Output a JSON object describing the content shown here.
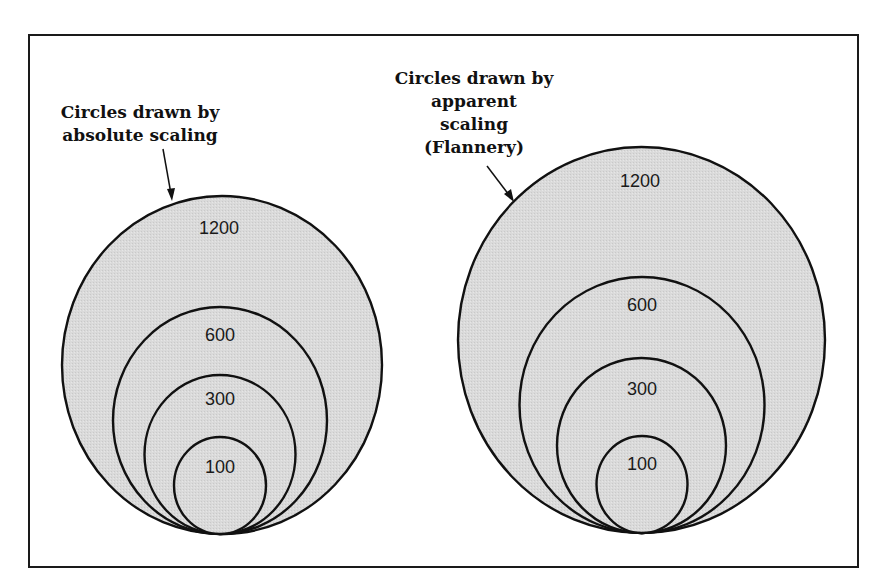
{
  "figure": {
    "colors": {
      "fill": "#d9d9d9",
      "stroke": "#111111",
      "background": "#ffffff"
    },
    "left_group": {
      "caption_lines": [
        "Circles drawn by",
        "absolute scaling"
      ],
      "method": "absolute scaling",
      "circles": [
        {
          "label": "1200",
          "value": 1200
        },
        {
          "label": "600",
          "value": 600
        },
        {
          "label": "300",
          "value": 300
        },
        {
          "label": "100",
          "value": 100
        }
      ]
    },
    "right_group": {
      "caption_lines": [
        "Circles drawn by",
        "apparent",
        "scaling",
        "(Flannery)"
      ],
      "method": "apparent scaling (Flannery)",
      "circles": [
        {
          "label": "1200",
          "value": 1200
        },
        {
          "label": "600",
          "value": 600
        },
        {
          "label": "300",
          "value": 300
        },
        {
          "label": "100",
          "value": 100
        }
      ]
    }
  }
}
